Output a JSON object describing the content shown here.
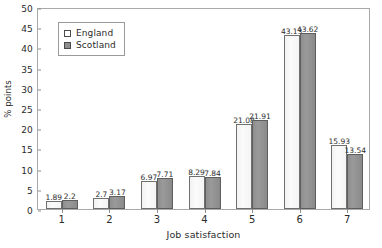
{
  "chart_data": {
    "type": "bar",
    "title": "",
    "xlabel": "Job satisfaction",
    "ylabel": "% points",
    "categories": [
      "1",
      "2",
      "3",
      "4",
      "5",
      "6",
      "7"
    ],
    "series": [
      {
        "name": "England",
        "values": [
          1.89,
          2.7,
          6.97,
          8.29,
          21.08,
          43.13,
          15.93
        ]
      },
      {
        "name": "Scotland",
        "values": [
          2.2,
          3.17,
          7.71,
          7.84,
          21.91,
          43.62,
          13.54
        ]
      }
    ],
    "value_labels": {
      "England": [
        "1.89",
        "2.7",
        "6.97",
        "8.29",
        "21.08",
        "43.13",
        "15.93"
      ],
      "Scotland": [
        "2.2",
        "3.17",
        "7.71",
        "7.84",
        "21.91",
        "43.62",
        "13.54"
      ]
    },
    "ylim": [
      0,
      50
    ],
    "yticks": [
      "0",
      "5",
      "10",
      "15",
      "20",
      "25",
      "30",
      "35",
      "40",
      "45",
      "50"
    ],
    "grid": false,
    "legend_position": "top-left",
    "colors": {
      "England": "#fbfbfb",
      "Scotland": "#8e8e8e",
      "frame": "#a9a9a9",
      "text": "#2b2b2b"
    }
  },
  "legend": {
    "items": [
      {
        "label": "England"
      },
      {
        "label": "Scotland"
      }
    ]
  }
}
